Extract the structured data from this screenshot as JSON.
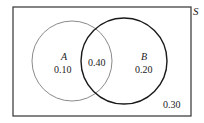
{
  "diagram": {
    "type": "venn",
    "universe_label": "S",
    "sets": [
      {
        "name": "A",
        "only_value": "0.10"
      },
      {
        "name": "B",
        "only_value": "0.20"
      }
    ],
    "intersection_value": "0.40",
    "outside_value": "0.30",
    "colors": {
      "circle_a": "#8a8a8a",
      "circle_b": "#1a1a1a",
      "frame": "#333333"
    }
  }
}
